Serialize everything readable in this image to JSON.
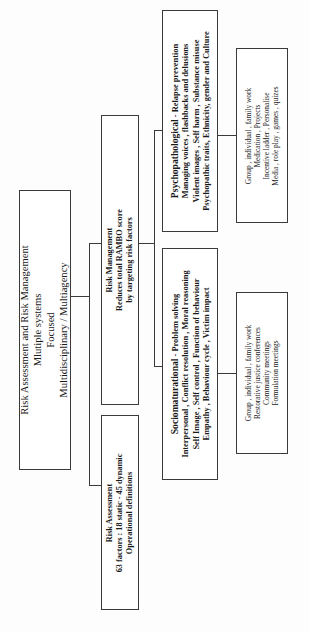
{
  "diagram": {
    "orientation": "rotated-90-ccw",
    "border_color": "#3a3a3a",
    "background_color": "#ffffff"
  },
  "nodes": {
    "root": {
      "lines": [
        "Risk Assessment and Risk Management",
        "Mlutiple systems",
        "Focused",
        "Multidisciplinary / Multiagency"
      ]
    },
    "risk_management": {
      "lines": [
        "Risk Management",
        "Reduces total RAMBO score",
        "by targeting risk factors"
      ]
    },
    "risk_assessment": {
      "lines": [
        "Risk Assessment",
        "63 factors : 18 static - 45 dynamic",
        "Operational definitions"
      ]
    },
    "psychopathological": {
      "heading": "Psychopathological",
      "heading_tail": " - Relapse prevention",
      "lines": [
        "Managing voices , flashbacks and delusions",
        "Violent images , Self harm , Substance misuse",
        "Psychopathic traits, Ethnicity, gender and Culture"
      ]
    },
    "psychopathological_methods": {
      "lines": [
        "Group , individual , family work",
        "Medication , Projects",
        "Incentive ladder , Personalise",
        "Media , role play , games , quizes"
      ]
    },
    "sociomaturational": {
      "heading": "Sociomaturational",
      "heading_tail": " - Problem solving",
      "lines": [
        "Interpersonal , Conflict resolution , Moral reasoning",
        "Self Image , Self control , Function of behaviour",
        "Empathy , Behaviour cycle , Victim impact"
      ]
    },
    "sociomaturational_methods": {
      "lines": [
        "Group , individual , family work",
        "Restorative justice conferences",
        "Community meetings",
        "Formulation meetings"
      ]
    }
  }
}
